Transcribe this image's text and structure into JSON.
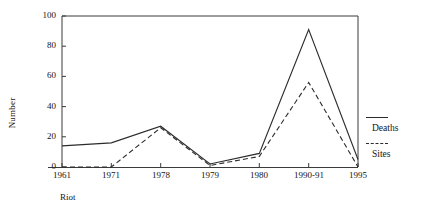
{
  "chart_data": {
    "type": "line",
    "title": "",
    "xlabel": "Riot",
    "ylabel": "Number",
    "ylim": [
      0,
      100
    ],
    "yticks": [
      0,
      20,
      40,
      60,
      80,
      100
    ],
    "grid": false,
    "legend_position": "right",
    "categories": [
      "1961",
      "1971",
      "1978",
      "1979",
      "1980",
      "1990-91",
      "1995"
    ],
    "series": [
      {
        "name": "Deaths",
        "style": "solid",
        "color": "#2b2b2b",
        "values": [
          14,
          16,
          27,
          2,
          9,
          91,
          5
        ]
      },
      {
        "name": "Sites",
        "style": "dashed",
        "color": "#2b2b2b",
        "values": [
          0,
          0,
          26,
          1,
          7,
          56,
          0
        ]
      }
    ]
  },
  "axes": {
    "y_title": "Number",
    "y_tick_labels": [
      "0",
      "20",
      "40",
      "60",
      "80",
      "100"
    ],
    "x_tick_labels": [
      "1961",
      "1971",
      "1978",
      "1979",
      "1980",
      "1990-91",
      "1995"
    ],
    "x_caption": "Riot"
  },
  "legend": {
    "entries": [
      {
        "label": "Deaths",
        "style": "solid"
      },
      {
        "label": "Sites",
        "style": "dashed"
      }
    ]
  },
  "colors": {
    "line": "#2b2b2b",
    "frame": "#3a3a3a",
    "text": "#141414",
    "background": "#ffffff"
  }
}
